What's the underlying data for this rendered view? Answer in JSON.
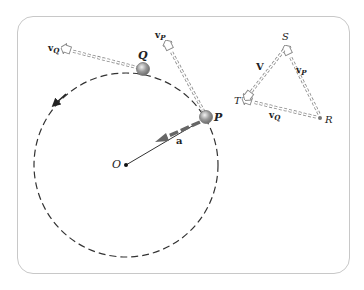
{
  "diagram": {
    "type": "circular-motion-velocity-diagram",
    "colors": {
      "frame": "#c8c8c8",
      "ink": "#222222",
      "vector_outline": "#8a8a8a",
      "accel_arrow": "#666666",
      "ball_fill": "#9a9a9a"
    },
    "circle": {
      "center_label": "O",
      "center": [
        126,
        165
      ],
      "radius": 92,
      "style": "dashed",
      "direction": "counterclockwise"
    },
    "points": {
      "P": {
        "label": "P",
        "pos": [
          206,
          117
        ]
      },
      "Q": {
        "label": "Q",
        "pos": [
          143,
          69
        ]
      }
    },
    "vectors": {
      "vP": {
        "label": "v",
        "sub": "P",
        "from": [
          206,
          117
        ],
        "to": [
          168,
          45
        ]
      },
      "vQ": {
        "label": "v",
        "sub": "Q",
        "from": [
          143,
          69
        ],
        "to": [
          65,
          49
        ]
      },
      "a": {
        "label": "a",
        "from": [
          199,
          122
        ],
        "to": [
          158,
          141
        ]
      }
    },
    "triangle": {
      "vertices": {
        "S": {
          "label": "S",
          "pos": [
            286,
            48
          ]
        },
        "R": {
          "label": "R",
          "pos": [
            320,
            118
          ]
        },
        "T": {
          "label": "T",
          "pos": [
            245,
            100
          ]
        }
      },
      "edges": {
        "vP": {
          "label": "v",
          "sub": "P",
          "from": "R",
          "to": "S"
        },
        "vQ": {
          "label": "v",
          "sub": "Q",
          "from": "R",
          "to": "T"
        },
        "V": {
          "label": "V",
          "from": "S",
          "to": "T"
        }
      }
    }
  }
}
